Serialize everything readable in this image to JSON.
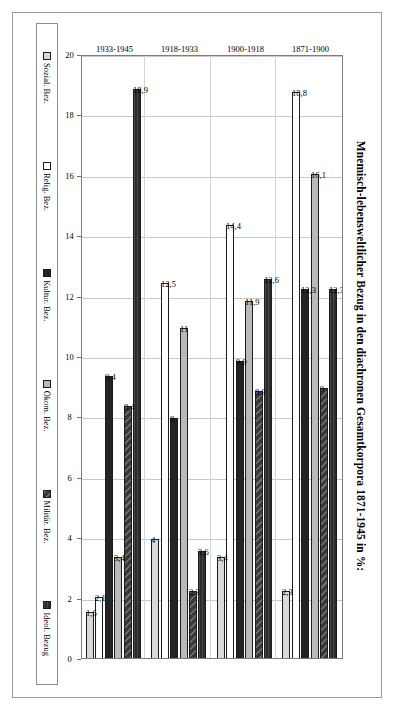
{
  "chart_data": {
    "type": "bar",
    "orientation": "horizontal",
    "title": "Mnemisch-lebensweltlicher Bezug in den diachronen Gesamtkorpora 1871-1945 in %:",
    "xlabel": "",
    "ylabel": "",
    "grid": true,
    "legend_position": "bottom",
    "value_axis": {
      "min": 0,
      "max": 20,
      "step": 2,
      "reversed": true,
      "ticks": [
        "20",
        "18",
        "16",
        "14",
        "12",
        "10",
        "8",
        "6",
        "4",
        "2",
        "0"
      ]
    },
    "categories": [
      "1871-1900",
      "1900-1918",
      "1918-1933",
      "1933-1945"
    ],
    "series": [
      {
        "name": "Ideol. Bezug",
        "color": "#2b2b2b",
        "values": [
          12.3,
          12.6,
          3.6,
          18.9
        ],
        "labels": [
          "12,3",
          "12,6",
          "3,6",
          "18,9"
        ]
      },
      {
        "name": "Militär. Bez.",
        "color": "#3a3a3a",
        "values": [
          9,
          8.9,
          2.3,
          8.4
        ],
        "labels": [
          "9",
          "8,9",
          "2,3",
          "8,4"
        ]
      },
      {
        "name": "Ökom. Bez.",
        "color": "#b9b9b9",
        "values": [
          16.1,
          11.9,
          11,
          3.4
        ],
        "labels": [
          "16,1",
          "11,9",
          "11",
          "3,4"
        ]
      },
      {
        "name": "Kultur. Bez.",
        "color": "#242424",
        "values": [
          12.3,
          9.9,
          8,
          9.4
        ],
        "labels": [
          "12,3",
          "9,9",
          "8",
          "9,4"
        ]
      },
      {
        "name": "Relig. Bez.",
        "color": "#ffffff",
        "values": [
          18.8,
          14.4,
          12.5,
          2.1
        ],
        "labels": [
          "18,8",
          "14,4",
          "12,5",
          "2,1"
        ]
      },
      {
        "name": "Sozial. Bez.",
        "color": "#d9d9d9",
        "values": [
          2.3,
          3.4,
          4,
          1.6
        ],
        "labels": [
          "2,3",
          "3,4",
          "4",
          "1,6"
        ]
      }
    ]
  },
  "legend": {
    "items": [
      {
        "label": "Ideol. Bezug",
        "swatch": "f-ideol"
      },
      {
        "label": "Militär. Bez.",
        "swatch": "f-militar"
      },
      {
        "label": "Ökom. Bez.",
        "swatch": "f-okon"
      },
      {
        "label": "Kultur. Bez.",
        "swatch": "f-kultur"
      },
      {
        "label": "Relig. Bez.",
        "swatch": "f-relig"
      },
      {
        "label": "Sozial. Bez.",
        "swatch": "f-sozial"
      }
    ]
  }
}
